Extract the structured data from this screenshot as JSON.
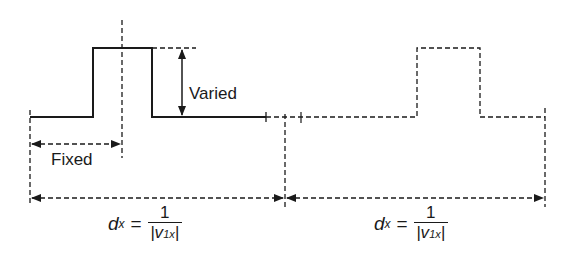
{
  "diagram": {
    "labels": {
      "varied": "Varied",
      "fixed": "Fixed"
    },
    "formulas": [
      {
        "lhs_var": "d",
        "lhs_sub": "x",
        "eq": "=",
        "num": "1",
        "den_open": "|v",
        "den_sub": "1x",
        "den_close": "|"
      },
      {
        "lhs_var": "d",
        "lhs_sub": "x",
        "eq": "=",
        "num": "1",
        "den_open": "|v",
        "den_sub": "1x",
        "den_close": "|"
      }
    ],
    "colors": {
      "line": "#1a1a1a",
      "background": "#ffffff"
    }
  }
}
